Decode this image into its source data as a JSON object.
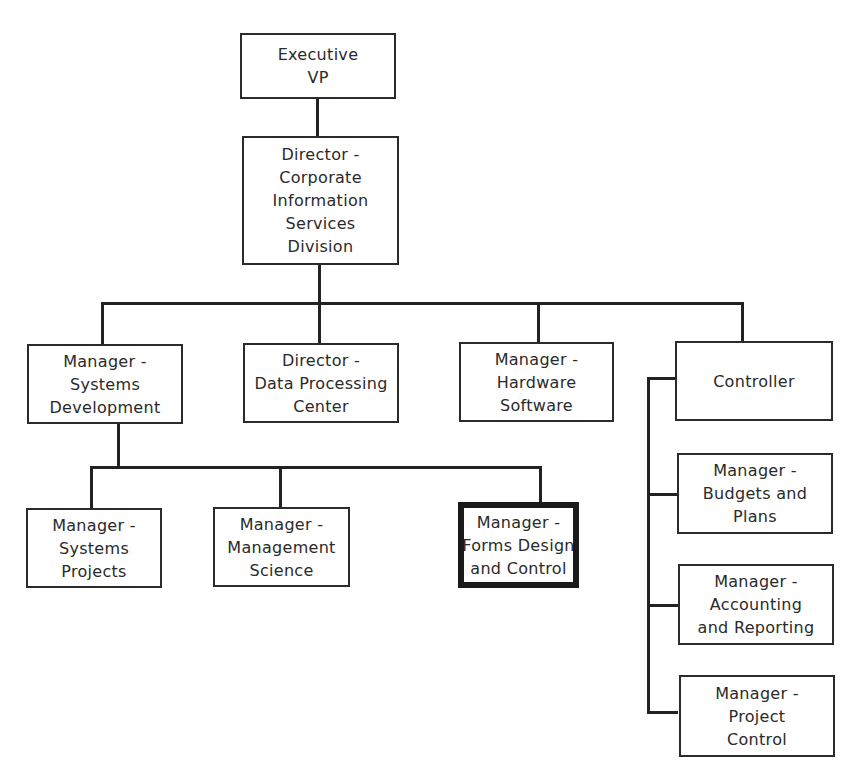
{
  "diagram": {
    "type": "organization-chart",
    "nodes": {
      "executive_vp": {
        "lines": [
          "Executive",
          "VP"
        ]
      },
      "director_cis": {
        "lines": [
          "Director -",
          "Corporate",
          "Information",
          "Services",
          "Division"
        ]
      },
      "manager_systems_development": {
        "lines": [
          "Manager -",
          "Systems",
          "Development"
        ]
      },
      "director_data_processing": {
        "lines": [
          "Director -",
          "Data Processing",
          "Center"
        ]
      },
      "manager_hardware_software": {
        "lines": [
          "Manager -",
          "Hardware",
          "Software"
        ]
      },
      "controller": {
        "lines": [
          "Controller"
        ]
      },
      "manager_systems_projects": {
        "lines": [
          "Manager -",
          "Systems",
          "Projects"
        ]
      },
      "manager_management_science": {
        "lines": [
          "Manager -",
          "Management",
          "Science"
        ]
      },
      "manager_forms_design": {
        "lines": [
          "Manager -",
          "Forms Design",
          "and Control"
        ],
        "highlighted": true
      },
      "manager_budgets_plans": {
        "lines": [
          "Manager -",
          "Budgets and",
          "Plans"
        ]
      },
      "manager_accounting_reporting": {
        "lines": [
          "Manager -",
          "Accounting",
          "and Reporting"
        ]
      },
      "manager_project_control": {
        "lines": [
          "Manager -",
          "Project",
          "Control"
        ]
      }
    },
    "edges": [
      [
        "executive_vp",
        "director_cis"
      ],
      [
        "director_cis",
        "manager_systems_development"
      ],
      [
        "director_cis",
        "director_data_processing"
      ],
      [
        "director_cis",
        "manager_hardware_software"
      ],
      [
        "director_cis",
        "controller"
      ],
      [
        "manager_systems_development",
        "manager_systems_projects"
      ],
      [
        "manager_systems_development",
        "manager_management_science"
      ],
      [
        "manager_systems_development",
        "manager_forms_design"
      ],
      [
        "controller",
        "manager_budgets_plans"
      ],
      [
        "controller",
        "manager_accounting_reporting"
      ],
      [
        "controller",
        "manager_project_control"
      ]
    ]
  }
}
